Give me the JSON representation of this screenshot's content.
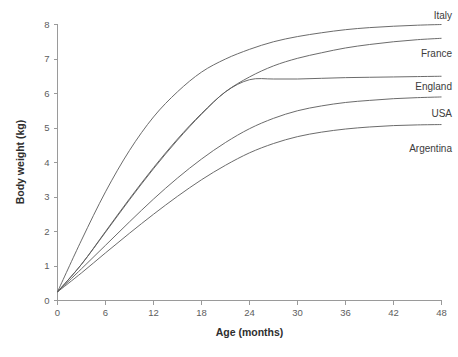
{
  "chart_data": {
    "type": "line",
    "title": "",
    "subtitle": "",
    "xlabel": "Age (months)",
    "ylabel": "Body weight (kg)",
    "xlim": [
      0,
      48
    ],
    "ylim": [
      0,
      8
    ],
    "xticks": [
      0,
      6,
      12,
      18,
      24,
      30,
      36,
      42,
      48
    ],
    "yticks": [
      0,
      1,
      2,
      3,
      4,
      5,
      6,
      7,
      8
    ],
    "xtick_labels": [
      "0",
      "6",
      "12",
      "18",
      "24",
      "30",
      "36",
      "42",
      "48"
    ],
    "ytick_labels": [
      "0",
      "1",
      "2",
      "3",
      "4",
      "5",
      "6",
      "7",
      "8"
    ],
    "grid": false,
    "legend_position": "right-end-of-line",
    "line_color": "#5a5a5a",
    "x": [
      0,
      3,
      6,
      9,
      12,
      15,
      18,
      21,
      24,
      27,
      30,
      33,
      36,
      39,
      42,
      45,
      48
    ],
    "series": [
      {
        "name": "Italy",
        "label": "Italy",
        "values": [
          0.25,
          1.75,
          3.15,
          4.35,
          5.32,
          6.05,
          6.62,
          7.0,
          7.28,
          7.5,
          7.65,
          7.76,
          7.85,
          7.91,
          7.95,
          7.98,
          8.0
        ]
      },
      {
        "name": "France",
        "label": "France",
        "values": [
          0.25,
          1.05,
          2.0,
          2.95,
          3.85,
          4.68,
          5.42,
          6.05,
          6.48,
          6.8,
          7.02,
          7.18,
          7.32,
          7.42,
          7.5,
          7.56,
          7.6
        ]
      },
      {
        "name": "England",
        "label": "England",
        "values": [
          0.25,
          1.05,
          1.98,
          2.92,
          3.82,
          4.65,
          5.4,
          6.05,
          6.4,
          6.42,
          6.42,
          6.44,
          6.46,
          6.47,
          6.48,
          6.49,
          6.5
        ]
      },
      {
        "name": "USA",
        "label": "USA",
        "values": [
          0.25,
          0.92,
          1.6,
          2.28,
          2.94,
          3.55,
          4.1,
          4.58,
          4.98,
          5.28,
          5.5,
          5.64,
          5.74,
          5.8,
          5.85,
          5.88,
          5.9
        ]
      },
      {
        "name": "Argentina",
        "label": "Argentina",
        "values": [
          0.25,
          0.8,
          1.38,
          1.95,
          2.5,
          3.02,
          3.5,
          3.92,
          4.28,
          4.55,
          4.75,
          4.88,
          4.97,
          5.03,
          5.07,
          5.09,
          5.1
        ]
      }
    ],
    "series_end_labels": [
      {
        "name": "Italy",
        "label": "Italy"
      },
      {
        "name": "France",
        "label": "France"
      },
      {
        "name": "England",
        "label": "England"
      },
      {
        "name": "USA",
        "label": "USA"
      },
      {
        "name": "Argentina",
        "label": "Argentina"
      }
    ]
  }
}
